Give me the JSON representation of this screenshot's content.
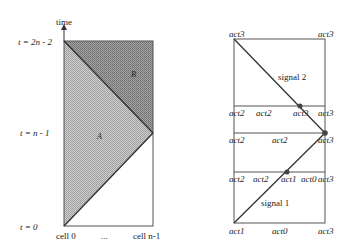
{
  "left_diagram": {
    "axis_label": "time",
    "y_labels": [
      "t = 2n - 2",
      "t = n - 1",
      "t = 0"
    ],
    "x_labels": [
      "cell 0",
      "...",
      "cell n-1"
    ],
    "regions": [
      "A",
      "B"
    ],
    "colors": {
      "region_a": "#b9b9b9",
      "region_b": "#8f8f8f",
      "line": "#333333"
    }
  },
  "right_diagram": {
    "rows": [
      {
        "labels": [
          "act3",
          "act3"
        ]
      },
      {
        "labels": [
          "act2",
          "act2",
          "act3",
          "act3"
        ]
      },
      {
        "labels": [
          "act2",
          "act2",
          "act3"
        ]
      },
      {
        "labels": [
          "act2",
          "act2",
          "act1",
          "act0",
          "act3"
        ]
      },
      {
        "labels": [
          "act1",
          "act0",
          "act3"
        ]
      }
    ],
    "signals": [
      "signal 2",
      "signal 1"
    ]
  }
}
